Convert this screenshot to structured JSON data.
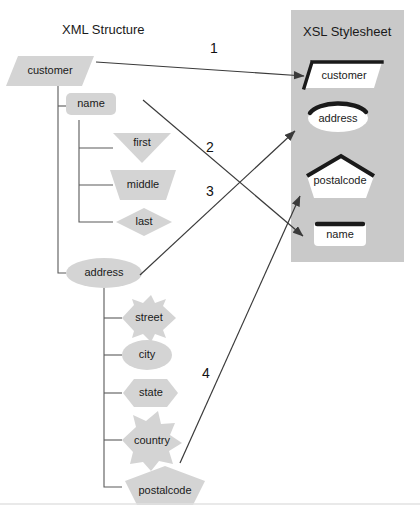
{
  "diagram": {
    "title_left": "XML Structure",
    "title_right": "XSL Stylesheet",
    "colors": {
      "node_fill": "#d4d4d4",
      "panel_fill": "#c9c9c9",
      "xsl_node_fill": "#ffffff",
      "xsl_node_stroke": "#1a1a1a",
      "line": "#4a4a4a",
      "text": "#1a1a1a",
      "background": "#ffffff",
      "divider": "#e2e2e2"
    }
  },
  "xml_tree": {
    "root": {
      "label": "customer",
      "shape": "parallelogram"
    },
    "children": [
      {
        "label": "name",
        "shape": "rounded-rect",
        "children": [
          {
            "label": "first",
            "shape": "triangle-down"
          },
          {
            "label": "middle",
            "shape": "trapezoid-down"
          },
          {
            "label": "last",
            "shape": "diamond"
          }
        ]
      },
      {
        "label": "address",
        "shape": "ellipse",
        "children": [
          {
            "label": "street",
            "shape": "star-4"
          },
          {
            "label": "city",
            "shape": "ellipse"
          },
          {
            "label": "state",
            "shape": "hexagon"
          },
          {
            "label": "country",
            "shape": "star-6"
          },
          {
            "label": "postalcode",
            "shape": "pentagon"
          }
        ]
      }
    ]
  },
  "xsl_panel": {
    "title": "XSL Stylesheet",
    "templates": [
      {
        "label": "customer",
        "shape": "parallelogram"
      },
      {
        "label": "address",
        "shape": "ellipse"
      },
      {
        "label": "postalcode",
        "shape": "pentagon"
      },
      {
        "label": "name",
        "shape": "rounded-rect"
      }
    ]
  },
  "mappings": [
    {
      "number": "1",
      "from": "customer",
      "to": "customer"
    },
    {
      "number": "2",
      "from": "name",
      "to": "name"
    },
    {
      "number": "3",
      "from": "address",
      "to": "address"
    },
    {
      "number": "4",
      "from": "postalcode",
      "to": "postalcode"
    }
  ]
}
